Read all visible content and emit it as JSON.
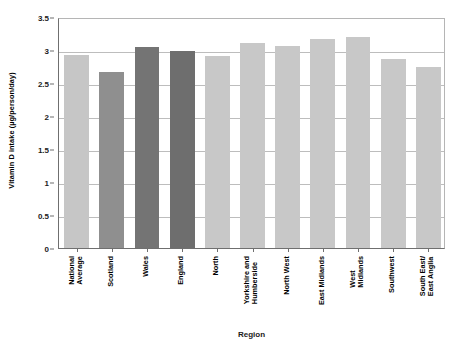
{
  "chart_data": {
    "type": "bar",
    "title": "",
    "xlabel": "Region",
    "ylabel": "Vitamin D intake (µg/person/day)",
    "ylim": [
      0,
      3.5
    ],
    "ytick_labels": [
      "3.5",
      "3",
      "2.5",
      "2",
      "1.5",
      "1",
      "0.5",
      "0"
    ],
    "ytick_values": [
      3.5,
      3,
      2.5,
      2,
      1.5,
      1,
      0.5,
      0
    ],
    "grid": "horizontal",
    "legend": "none",
    "categories": [
      "National Average",
      "Scotland",
      "Wales",
      "England",
      "North",
      "Yorkshire and Humberside",
      "North West",
      "East Midlands",
      "West Midlands",
      "Southwest",
      "South East/ East Anglia"
    ],
    "category_lines": [
      [
        "National",
        "Average"
      ],
      [
        "Scotland"
      ],
      [
        "Wales"
      ],
      [
        "England"
      ],
      [
        "North"
      ],
      [
        "Yorkshire and",
        "Humberside"
      ],
      [
        "North West"
      ],
      [
        "East Midlands"
      ],
      [
        "West",
        "Midlands"
      ],
      [
        "Southwest"
      ],
      [
        "South East/",
        "East Anglia"
      ]
    ],
    "values": [
      2.93,
      2.66,
      3.05,
      2.99,
      2.91,
      3.11,
      3.06,
      3.16,
      3.19,
      2.87,
      2.75
    ],
    "bar_colors": [
      "#c6c6c6",
      "#8f8f8f",
      "#747474",
      "#6e6e6e",
      "#c8c8c8",
      "#c8c8c8",
      "#c8c8c8",
      "#c8c8c8",
      "#c8c8c8",
      "#c8c8c8",
      "#c8c8c8"
    ]
  }
}
